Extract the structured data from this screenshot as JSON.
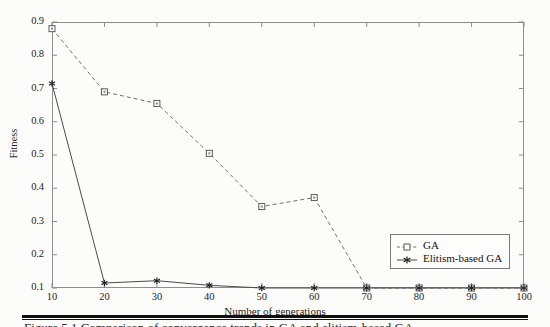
{
  "figure": {
    "caption": "Figure 5.1   Comparison of convergence trends in GA and elitism-based GA."
  },
  "chart_data": {
    "type": "line",
    "title": "",
    "xlabel": "Number of generations",
    "ylabel": "Fitness",
    "x": [
      10,
      20,
      30,
      40,
      50,
      60,
      70,
      80,
      90,
      100
    ],
    "xticklabels": [
      "10",
      "20",
      "30",
      "40",
      "50",
      "60",
      "70",
      "80",
      "90",
      "100"
    ],
    "yticklabels": [
      "0.1",
      "0.2",
      "0.3",
      "0.4",
      "0.5",
      "0.6",
      "0.7",
      "0.8",
      "0.9"
    ],
    "xlim": [
      10,
      100
    ],
    "ylim": [
      0.1,
      0.9
    ],
    "grid": false,
    "legend_position": "lower right",
    "series": [
      {
        "name": "GA",
        "values": [
          0.88,
          0.69,
          0.655,
          0.505,
          0.345,
          0.372,
          0.1,
          0.1,
          0.1,
          0.1
        ],
        "linestyle": "dashed",
        "marker": "open-square",
        "color": "#6f6f6f"
      },
      {
        "name": "Elitism-based GA",
        "values": [
          0.715,
          0.115,
          0.122,
          0.108,
          0.1,
          0.1,
          0.1,
          0.1,
          0.1,
          0.1
        ],
        "linestyle": "solid",
        "marker": "star",
        "color": "#4a4a4a"
      }
    ]
  },
  "legend": {
    "entries": [
      {
        "label": "GA"
      },
      {
        "label": "Elitism-based GA"
      }
    ]
  },
  "colors": {
    "axis": "#8d8d8d",
    "text": "#1d1d1d",
    "ga_line": "#6f6f6f",
    "elitism_line": "#4a4a4a",
    "page_background": "#fcfcfa"
  }
}
